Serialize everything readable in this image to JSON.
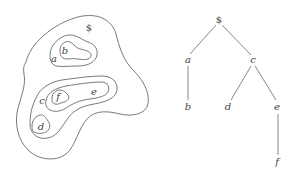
{
  "figure": {
    "left_panel": {
      "type": "nested-regions",
      "labels": {
        "root": "$",
        "a": "a",
        "b": "b",
        "c": "c",
        "d": "d",
        "e": "e",
        "f": "f"
      }
    },
    "right_panel": {
      "type": "tree",
      "nodes": {
        "root": "$",
        "a": "a",
        "b": "b",
        "c": "c",
        "d": "d",
        "e": "e",
        "f": "f"
      },
      "edges": [
        [
          "$",
          "a"
        ],
        [
          "$",
          "c"
        ],
        [
          "a",
          "b"
        ],
        [
          "c",
          "d"
        ],
        [
          "c",
          "e"
        ],
        [
          "e",
          "f"
        ]
      ]
    },
    "colors": {
      "stroke": "#6a6a6a",
      "text": "#444444",
      "background": "#ffffff"
    }
  }
}
